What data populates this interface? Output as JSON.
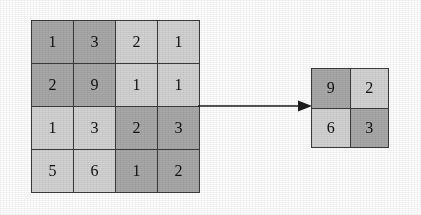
{
  "diagram": {
    "background_color": "#ffffff",
    "grid_line_color": "#3b3b3b",
    "digit_color": "#111111",
    "shade_colors": {
      "dark": "#a9a9a9",
      "light": "#d3d3d3"
    }
  },
  "input_matrix": {
    "label": "input-feature-map",
    "rows": 4,
    "cols": 4,
    "cells": [
      {
        "value": "1",
        "shade": "dark"
      },
      {
        "value": "3",
        "shade": "dark"
      },
      {
        "value": "2",
        "shade": "light"
      },
      {
        "value": "1",
        "shade": "light"
      },
      {
        "value": "2",
        "shade": "dark"
      },
      {
        "value": "9",
        "shade": "dark"
      },
      {
        "value": "1",
        "shade": "light"
      },
      {
        "value": "1",
        "shade": "light"
      },
      {
        "value": "1",
        "shade": "light"
      },
      {
        "value": "3",
        "shade": "light"
      },
      {
        "value": "2",
        "shade": "dark"
      },
      {
        "value": "3",
        "shade": "dark"
      },
      {
        "value": "5",
        "shade": "light"
      },
      {
        "value": "6",
        "shade": "light"
      },
      {
        "value": "1",
        "shade": "dark"
      },
      {
        "value": "2",
        "shade": "dark"
      }
    ]
  },
  "arrow": {
    "label": "pooling-arrow",
    "direction": "right",
    "color": "#1c1c1c"
  },
  "output_matrix": {
    "label": "pooled-output",
    "rows": 2,
    "cols": 2,
    "cells": [
      {
        "value": "9",
        "shade": "dark"
      },
      {
        "value": "2",
        "shade": "light"
      },
      {
        "value": "6",
        "shade": "light"
      },
      {
        "value": "3",
        "shade": "dark"
      }
    ]
  }
}
